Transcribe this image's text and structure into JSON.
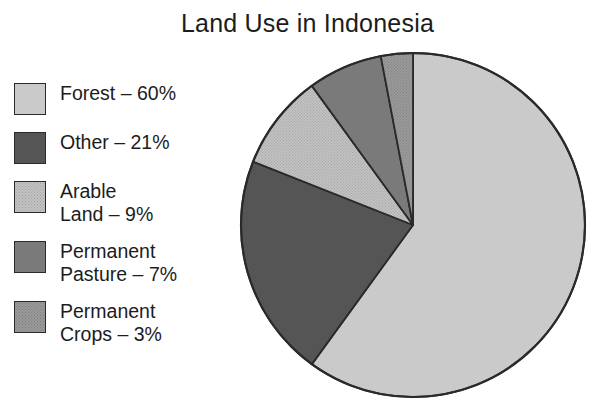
{
  "chart_data": {
    "type": "pie",
    "title": "Land Use in Indonesia",
    "xlabel": "",
    "ylabel": "",
    "legend_position": "left",
    "grid": false,
    "units": "percent",
    "start_angle_deg": 0,
    "direction": "clockwise",
    "categories": [
      "Forest",
      "Other",
      "Arable Land",
      "Permanent Pasture",
      "Permanent Crops"
    ],
    "values": [
      60,
      21,
      9,
      7,
      3
    ],
    "slices": [
      {
        "name": "Forest",
        "label": "Forest – 60%",
        "value": 60,
        "color": "#cacaca",
        "pattern": "solid",
        "start_deg": 0,
        "end_deg": 216
      },
      {
        "name": "Other",
        "label": "Other – 21%",
        "value": 21,
        "color": "#555555",
        "pattern": "solid",
        "start_deg": 216,
        "end_deg": 291.6
      },
      {
        "name": "Arable Land",
        "label": "Arable\nLand – 9%",
        "value": 9,
        "color": "#c2c2c2",
        "pattern": "stipple",
        "start_deg": 291.6,
        "end_deg": 324
      },
      {
        "name": "Permanent Pasture",
        "label": "Permanent\nPasture – 7%",
        "value": 7,
        "color": "#7a7a7a",
        "pattern": "solid",
        "start_deg": 324,
        "end_deg": 349.2
      },
      {
        "name": "Permanent Crops",
        "label": "Permanent\nCrops – 3%",
        "value": 3,
        "color": "#9a9a9a",
        "pattern": "stipple",
        "start_deg": 349.2,
        "end_deg": 360
      }
    ]
  },
  "title": {
    "text": "Land Use in Indonesia"
  },
  "legend": {
    "items": [
      {
        "label": "Forest – 60%",
        "swatch_class": "sw-forest",
        "value": 60
      },
      {
        "label": "Other – 21%",
        "swatch_class": "sw-other",
        "value": 21
      },
      {
        "label": "Arable\nLand – 9%",
        "swatch_class": "sw-arable",
        "value": 9
      },
      {
        "label": "Permanent\nPasture – 7%",
        "swatch_class": "sw-pasture",
        "value": 7
      },
      {
        "label": "Permanent\nCrops – 3%",
        "swatch_class": "sw-crops",
        "value": 3
      }
    ]
  },
  "colors": {
    "background": "#ffffff",
    "text": "#1c1c1c",
    "outline": "#2a2a2a",
    "forest": "#cacaca",
    "other": "#555555",
    "arable": "#c2c2c2",
    "pasture": "#7a7a7a",
    "crops": "#9a9a9a"
  }
}
